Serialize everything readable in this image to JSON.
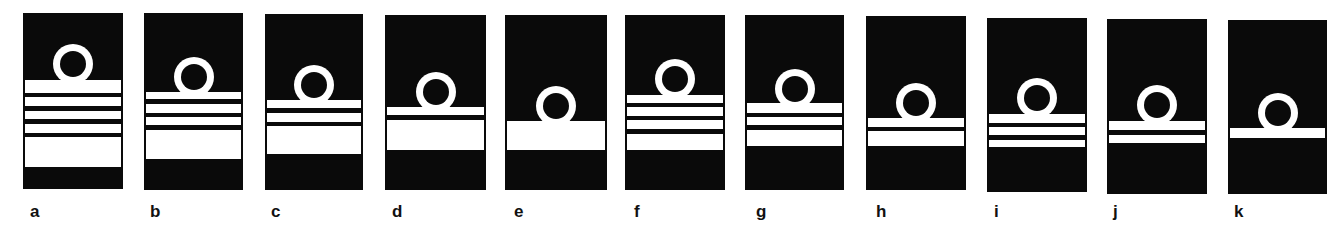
{
  "figure": {
    "colors": {
      "background": "#ffffff",
      "panel": "#0a0a0a",
      "stripe": "#ffffff"
    },
    "panels": [
      {
        "label": "a",
        "left": 23,
        "top": 13,
        "width": 100,
        "height": 176,
        "ring_top": 44,
        "label_x": 30,
        "stripes": [
          [
            80,
            93
          ],
          [
            97,
            106
          ],
          [
            111,
            119
          ],
          [
            124,
            133
          ],
          [
            137,
            167
          ]
        ]
      },
      {
        "label": "b",
        "left": 144,
        "top": 13,
        "width": 99,
        "height": 177,
        "ring_top": 57,
        "label_x": 150,
        "stripes": [
          [
            92,
            99
          ],
          [
            104,
            113
          ],
          [
            117,
            125
          ],
          [
            130,
            159
          ]
        ]
      },
      {
        "label": "c",
        "left": 265,
        "top": 14,
        "width": 98,
        "height": 176,
        "ring_top": 65,
        "label_x": 271,
        "stripes": [
          [
            100,
            108
          ],
          [
            113,
            122
          ],
          [
            126,
            154
          ]
        ]
      },
      {
        "label": "d",
        "left": 385,
        "top": 15,
        "width": 101,
        "height": 175,
        "ring_top": 72,
        "label_x": 392,
        "stripes": [
          [
            107,
            115
          ],
          [
            120,
            150
          ]
        ]
      },
      {
        "label": "e",
        "left": 505,
        "top": 15,
        "width": 102,
        "height": 175,
        "ring_top": 86,
        "label_x": 514,
        "stripes": [
          [
            121,
            150
          ]
        ]
      },
      {
        "label": "f",
        "left": 625,
        "top": 15,
        "width": 100,
        "height": 175,
        "ring_top": 59,
        "label_x": 634,
        "stripes": [
          [
            95,
            103
          ],
          [
            107,
            116
          ],
          [
            120,
            129
          ],
          [
            134,
            150
          ]
        ]
      },
      {
        "label": "g",
        "left": 745,
        "top": 15,
        "width": 99,
        "height": 175,
        "ring_top": 69,
        "label_x": 756,
        "stripes": [
          [
            103,
            113
          ],
          [
            117,
            125
          ],
          [
            130,
            146
          ]
        ]
      },
      {
        "label": "h",
        "left": 866,
        "top": 16,
        "width": 100,
        "height": 174,
        "ring_top": 83,
        "label_x": 876,
        "stripes": [
          [
            118,
            127
          ],
          [
            131,
            146
          ]
        ]
      },
      {
        "label": "i",
        "left": 987,
        "top": 18,
        "width": 100,
        "height": 174,
        "ring_top": 78,
        "label_x": 994,
        "stripes": [
          [
            114,
            123
          ],
          [
            127,
            135
          ],
          [
            140,
            147
          ]
        ]
      },
      {
        "label": "j",
        "left": 1107,
        "top": 19,
        "width": 100,
        "height": 175,
        "ring_top": 85,
        "label_x": 1113,
        "stripes": [
          [
            121,
            130
          ],
          [
            135,
            143
          ]
        ]
      },
      {
        "label": "k",
        "left": 1228,
        "top": 20,
        "width": 99,
        "height": 174,
        "ring_top": 93,
        "label_x": 1234,
        "stripes": [
          [
            128,
            138
          ]
        ]
      }
    ]
  }
}
